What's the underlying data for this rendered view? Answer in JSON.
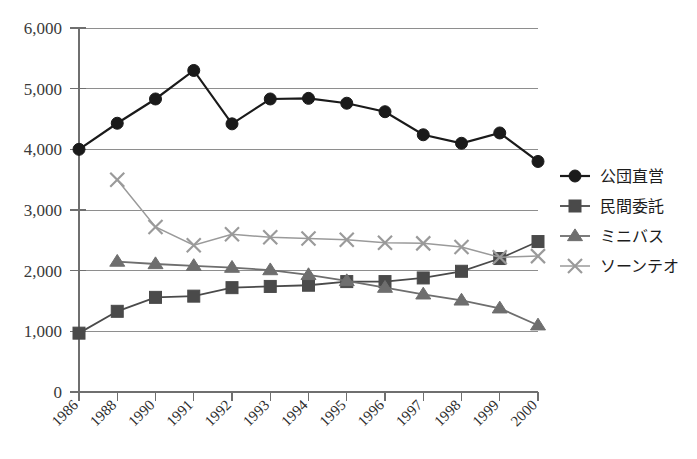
{
  "chart_data": {
    "type": "line",
    "title": "",
    "subtitle": "",
    "xlabel": "",
    "ylabel": "",
    "ylim": [
      0,
      6000
    ],
    "ytick_values": [
      0,
      1000,
      2000,
      3000,
      4000,
      5000,
      6000
    ],
    "ytick_labels": [
      "0",
      "1,000",
      "2,000",
      "3,000",
      "4,000",
      "5,000",
      "6,000"
    ],
    "grid": "horizontal",
    "legend_position": "right",
    "categories": [
      "1986",
      "1988",
      "1990",
      "1991",
      "1992",
      "1993",
      "1994",
      "1995",
      "1996",
      "1997",
      "1998",
      "1999",
      "2000"
    ],
    "series": [
      {
        "name": "公団直営",
        "marker": "circle",
        "color": "#1a1a1a",
        "values": [
          4000,
          4430,
          4830,
          5300,
          4420,
          4830,
          4840,
          4760,
          4620,
          4240,
          4100,
          4270,
          3800
        ]
      },
      {
        "name": "民間委託",
        "marker": "square",
        "color": "#4a4a4a",
        "values": [
          970,
          1330,
          1560,
          1580,
          1720,
          1740,
          1760,
          1820,
          1820,
          1880,
          1990,
          2200,
          2480
        ]
      },
      {
        "name": "ミニバス",
        "marker": "triangle",
        "color": "#6e6e6e",
        "values": [
          null,
          2150,
          2110,
          2080,
          2050,
          2010,
          1930,
          1830,
          1720,
          1610,
          1510,
          1380,
          1100
        ]
      },
      {
        "name": "ソーンテオ",
        "marker": "x",
        "color": "#9a9a9a",
        "values": [
          null,
          3500,
          2720,
          2420,
          2600,
          2550,
          2530,
          2510,
          2460,
          2450,
          2390,
          2220,
          2240
        ]
      }
    ]
  },
  "legend": {
    "entries": [
      {
        "label": "公団直営"
      },
      {
        "label": "民間委託"
      },
      {
        "label": "ミニバス"
      },
      {
        "label": "ソーンテオ"
      }
    ]
  }
}
